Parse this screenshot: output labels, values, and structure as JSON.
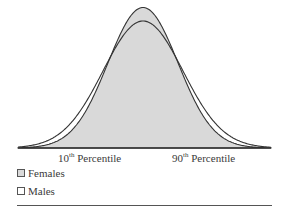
{
  "chart_data": {
    "type": "area",
    "title": "",
    "xlabel": "",
    "ylabel": "",
    "grid": false,
    "legend_position": "bottom-left",
    "x_ticks": [
      {
        "base": "10",
        "sup": "th",
        "label": "Percentile"
      },
      {
        "base": "90",
        "sup": "th",
        "label": "Percentile"
      }
    ],
    "series": [
      {
        "name": "Females",
        "shape": "normal",
        "mean": 0,
        "relative_sd": 0.9,
        "relative_peak": 1.0,
        "fill": "#d9d9d9"
      },
      {
        "name": "Males",
        "shape": "normal",
        "mean": 0,
        "relative_sd": 1.0,
        "relative_peak": 0.9,
        "fill": "none"
      }
    ],
    "annotation": "Overlapping bell curves: females narrower and taller, males wider and shorter"
  },
  "legend": {
    "females": "Females",
    "males": "Males"
  },
  "colors": {
    "females_fill": "#d9d9d9",
    "line": "#333333"
  }
}
